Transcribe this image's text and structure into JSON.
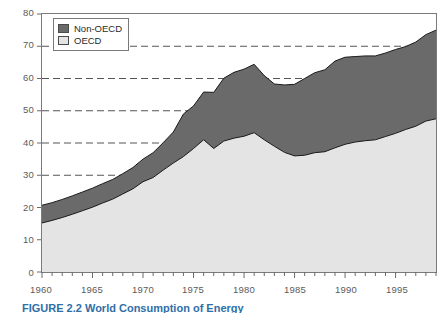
{
  "figure": {
    "caption": "FIGURE 2.2  World Consumption of Energy"
  },
  "legend": {
    "position": "top-left",
    "entries": [
      {
        "label": "Non-OECD",
        "color": "#6a6a6a",
        "icon": "legend-swatch-icon"
      },
      {
        "label": "OECD",
        "color": "#e4e4e4",
        "icon": "legend-swatch-icon"
      }
    ]
  },
  "axes": {
    "y_ticks": [
      "80",
      "70",
      "60",
      "50",
      "40",
      "30",
      "20",
      "10",
      "0"
    ],
    "x_ticks": [
      "1960",
      "1965",
      "1970",
      "1975",
      "1980",
      "1985",
      "1990",
      "1995"
    ]
  },
  "chart_data": {
    "type": "area",
    "title": "",
    "subtitle": "",
    "xlabel": "",
    "ylabel": "",
    "xlim": [
      1960,
      1999
    ],
    "ylim": [
      0,
      80
    ],
    "grid": true,
    "grid_values": [
      30,
      40,
      50,
      60,
      70
    ],
    "grid_style": "dashed",
    "legend_position": "top-left",
    "stacked": true,
    "x": [
      1960,
      1961,
      1962,
      1963,
      1964,
      1965,
      1966,
      1967,
      1968,
      1969,
      1970,
      1971,
      1972,
      1973,
      1974,
      1975,
      1976,
      1977,
      1978,
      1979,
      1980,
      1981,
      1982,
      1983,
      1984,
      1985,
      1986,
      1987,
      1988,
      1989,
      1990,
      1991,
      1992,
      1993,
      1994,
      1995,
      1996,
      1997,
      1998,
      1999
    ],
    "series": [
      {
        "name": "OECD",
        "color": "#e4e4e4",
        "values": [
          15.2,
          16.0,
          16.9,
          17.9,
          19.0,
          20.1,
          21.4,
          22.6,
          24.2,
          25.8,
          28.0,
          29.3,
          31.6,
          33.8,
          35.8,
          38.3,
          41.0,
          38.3,
          40.6,
          41.5,
          42.1,
          43.2,
          41.0,
          39.0,
          37.1,
          36.0,
          36.2,
          37.0,
          37.3,
          38.5,
          39.6,
          40.3,
          40.7,
          41.0,
          42.0,
          43.0,
          44.2,
          45.2,
          46.8,
          47.5
        ]
      },
      {
        "name": "Non-OECD",
        "color": "#6a6a6a",
        "values": [
          5.5,
          5.5,
          5.6,
          5.7,
          5.8,
          5.9,
          6.0,
          6.1,
          6.3,
          6.6,
          7.0,
          7.7,
          8.5,
          9.6,
          13.2,
          13.2,
          14.8,
          17.4,
          19.5,
          20.4,
          20.8,
          21.2,
          19.9,
          19.3,
          20.9,
          22.2,
          23.8,
          24.8,
          25.4,
          26.9,
          27.0,
          26.5,
          26.3,
          26.0,
          25.9,
          26.0,
          25.7,
          26.1,
          26.8,
          27.5
        ]
      }
    ],
    "totals": [
      20.7,
      21.5,
      22.5,
      23.6,
      24.8,
      26.0,
      27.4,
      28.7,
      30.5,
      32.4,
      35.0,
      37.0,
      40.1,
      43.4,
      49.0,
      51.5,
      55.8,
      55.7,
      60.1,
      61.9,
      62.9,
      64.4,
      60.9,
      58.3,
      58.0,
      58.2,
      60.0,
      61.8,
      62.7,
      65.4,
      66.6,
      66.8,
      67.0,
      67.0,
      67.9,
      69.0,
      69.9,
      71.3,
      73.6,
      75.0
    ]
  }
}
